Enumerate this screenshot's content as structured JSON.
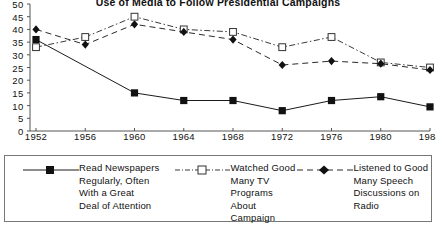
{
  "chart_data": {
    "type": "line",
    "title": "Use of Media to Follow Presidential Campaigns",
    "xlabel": "",
    "ylabel": "",
    "x": [
      1952,
      1956,
      1960,
      1964,
      1968,
      1972,
      1976,
      1980,
      1984
    ],
    "categories": [
      "1952",
      "1956",
      "1960",
      "1964",
      "1968",
      "1972",
      "1976",
      "1980",
      "1984"
    ],
    "ylim": [
      0,
      50
    ],
    "yticks": [
      0,
      5,
      10,
      15,
      20,
      25,
      30,
      35,
      40,
      45,
      50
    ],
    "grid": false,
    "legend_position": "bottom",
    "series": [
      {
        "name": "Read Newspapers Regularly, Often With a Great Deal of Attention",
        "legend_label": "Read Newspapers\nRegularly, Often\nWith a Great\nDeal of Attention",
        "marker": "filled-square",
        "line_style": "solid",
        "color": "#1a1a1a",
        "values": [
          36,
          null,
          15,
          12,
          12,
          8,
          12,
          13.5,
          9.5
        ]
      },
      {
        "name": "Watched Good Many TV Programs About Campaign",
        "legend_label": "Watched Good\nMany TV\nPrograms About\nCampaign",
        "marker": "open-square",
        "line_style": "dash-dot",
        "color": "#3a3a3a",
        "values": [
          33,
          37,
          45,
          40,
          39,
          33,
          37,
          27,
          25
        ]
      },
      {
        "name": "Listened to Good Many Speech Discussions on Radio",
        "legend_label": "Listened to Good\nMany Speech\nDiscussions on\nRadio",
        "marker": "filled-diamond",
        "line_style": "dashed",
        "color": "#2a2a2a",
        "values": [
          40,
          34,
          42,
          39,
          36,
          26,
          27.5,
          26.5,
          24
        ]
      }
    ]
  },
  "axis": {
    "y_tick_labels": [
      "50",
      "45",
      "40",
      "35",
      "30",
      "25",
      "20",
      "15",
      "10",
      "5",
      "0"
    ],
    "x_tick_labels": [
      "1952",
      "1956",
      "1960",
      "1964",
      "1968",
      "1972",
      "1976",
      "1980",
      "1984"
    ]
  },
  "legend": {
    "entries": [
      {
        "label": "Read Newspapers\nRegularly, Often\nWith a Great\nDeal of Attention",
        "marker": "filled-square-icon"
      },
      {
        "label": "Watched Good\nMany TV\nPrograms About\nCampaign",
        "marker": "open-square-icon"
      },
      {
        "label": "Listened to Good\nMany Speech\nDiscussions on\nRadio",
        "marker": "filled-diamond-icon"
      }
    ]
  }
}
